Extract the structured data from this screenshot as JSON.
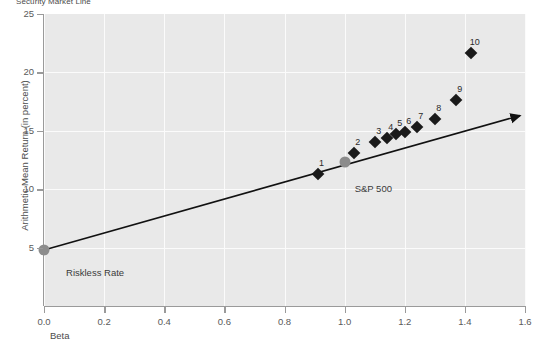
{
  "chart_data": {
    "type": "scatter",
    "title": "Security Market Line",
    "xlabel": "Beta",
    "ylabel": "Arithmetic Mean Return (in percent)",
    "xlim": [
      0.0,
      1.6
    ],
    "ylim": [
      0,
      25
    ],
    "xticks": [
      "0.0",
      "0.2",
      "0.4",
      "0.6",
      "0.8",
      "1.0",
      "1.2",
      "1.4",
      "1.6"
    ],
    "xtick_values": [
      0.0,
      0.2,
      0.4,
      0.6,
      0.8,
      1.0,
      1.2,
      1.4,
      1.6
    ],
    "yticks": [
      "25",
      "20",
      "15",
      "10",
      "5"
    ],
    "ytick_values": [
      25,
      20,
      15,
      10,
      5
    ],
    "grid": true,
    "legend": "none",
    "series": [
      {
        "name": "Portfolios",
        "marker": "diamond",
        "color": "#1a1a1a",
        "points": [
          {
            "label": "1",
            "x": 0.91,
            "y": 11.3
          },
          {
            "label": "2",
            "x": 1.03,
            "y": 13.1
          },
          {
            "label": "3",
            "x": 1.1,
            "y": 14.0
          },
          {
            "label": "4",
            "x": 1.14,
            "y": 14.4
          },
          {
            "label": "5",
            "x": 1.17,
            "y": 14.7
          },
          {
            "label": "6",
            "x": 1.2,
            "y": 14.9
          },
          {
            "label": "7",
            "x": 1.24,
            "y": 15.3
          },
          {
            "label": "8",
            "x": 1.3,
            "y": 16.0
          },
          {
            "label": "9",
            "x": 1.37,
            "y": 17.6
          },
          {
            "label": "10",
            "x": 1.42,
            "y": 21.7
          }
        ]
      },
      {
        "name": "Benchmarks",
        "marker": "circle",
        "color": "#8c8c8c",
        "points": [
          {
            "label": "Riskless Rate",
            "x": 0.0,
            "y": 4.8
          },
          {
            "label": "S&P 500",
            "x": 1.0,
            "y": 12.3
          }
        ]
      }
    ],
    "line": {
      "name": "Security Market Line",
      "color": "#111111",
      "arrow_end": true,
      "from": {
        "x": 0.0,
        "y": 4.8
      },
      "to": {
        "x": 1.6,
        "y": 16.6
      }
    },
    "annotations": [
      {
        "text": "Riskless Rate",
        "x": 0.05,
        "y": 3.3
      },
      {
        "text": "S&P 500",
        "x": 1.01,
        "y": 10.5
      }
    ]
  }
}
